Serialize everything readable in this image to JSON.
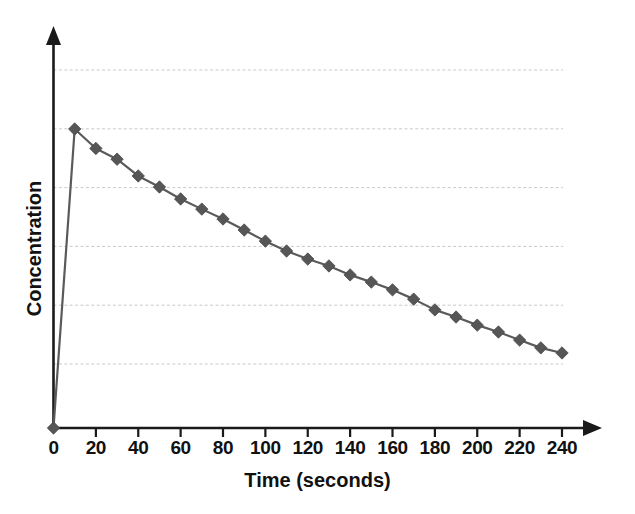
{
  "chart_data": {
    "type": "line",
    "title": "",
    "xlabel": "Time (seconds)",
    "ylabel": "Concentration",
    "xlim": [
      0,
      240
    ],
    "ylim": [
      0,
      1.05
    ],
    "grid": true,
    "gridline_count": 6,
    "legend": null,
    "legend_position": "none",
    "marker": "diamond",
    "series_color": "#565656",
    "axis_color": "#1a1a1a",
    "grid_color": "#c9c9c9",
    "xticks": [
      0,
      20,
      40,
      60,
      80,
      100,
      120,
      140,
      160,
      180,
      200,
      220,
      240
    ],
    "xtick_labels": [
      "0",
      "20",
      "40",
      "60",
      "80",
      "100",
      "120",
      "140",
      "160",
      "180",
      "200",
      "220",
      "240"
    ],
    "yticks": [],
    "ytick_labels": [],
    "x": [
      0,
      10,
      20,
      30,
      40,
      50,
      60,
      70,
      80,
      90,
      100,
      110,
      120,
      130,
      140,
      150,
      160,
      170,
      180,
      190,
      200,
      210,
      220,
      230,
      240
    ],
    "values": [
      0.0,
      1.0,
      0.935,
      0.899,
      0.843,
      0.806,
      0.766,
      0.732,
      0.699,
      0.662,
      0.625,
      0.592,
      0.565,
      0.542,
      0.512,
      0.488,
      0.462,
      0.431,
      0.395,
      0.371,
      0.344,
      0.321,
      0.294,
      0.268,
      0.251
    ],
    "series": [
      {
        "name": "Concentration",
        "x": [
          0,
          10,
          20,
          30,
          40,
          50,
          60,
          70,
          80,
          90,
          100,
          110,
          120,
          130,
          140,
          150,
          160,
          170,
          180,
          190,
          200,
          210,
          220,
          230,
          240
        ],
        "values": [
          0.0,
          1.0,
          0.935,
          0.899,
          0.843,
          0.806,
          0.766,
          0.732,
          0.699,
          0.662,
          0.625,
          0.592,
          0.565,
          0.542,
          0.512,
          0.488,
          0.462,
          0.431,
          0.395,
          0.371,
          0.344,
          0.321,
          0.294,
          0.268,
          0.251
        ]
      }
    ],
    "annotations": []
  },
  "axes": {
    "x_axis_name": "time-axis",
    "y_axis_name": "concentration-axis",
    "x_arrowhead": true,
    "y_arrowhead": true
  }
}
